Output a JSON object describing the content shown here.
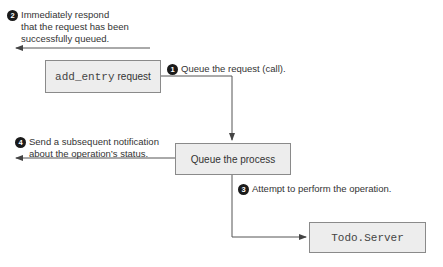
{
  "boxes": {
    "request": {
      "code": "add_entry",
      "label": "request"
    },
    "queue": {
      "label": "Queue the process"
    },
    "server": {
      "code": "Todo.Server"
    }
  },
  "steps": [
    {
      "number": "1",
      "text": "Queue the request (call)."
    },
    {
      "number": "2",
      "lines": [
        "Immediately respond",
        "that the request has been",
        "successfully queued."
      ]
    },
    {
      "number": "3",
      "text": "Attempt to perform the operation."
    },
    {
      "number": "4",
      "lines": [
        "Send a subsequent notification",
        "about the operation’s status."
      ]
    }
  ],
  "colors": {
    "box_fill": "#ededed",
    "box_border": "#8a8a8a",
    "line": "#555555",
    "badge": "#1a1a1a"
  }
}
